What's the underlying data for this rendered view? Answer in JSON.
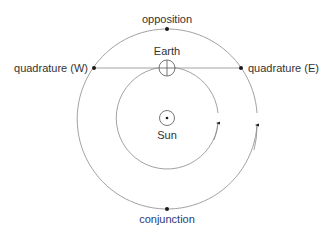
{
  "diagram": {
    "labels": {
      "opposition": "opposition",
      "quadrature_west": "quadrature (W)",
      "quadrature_east": "quadrature (E)",
      "earth": "Earth",
      "sun": "Sun",
      "conjunction": "conjunction"
    },
    "colors": {
      "orbit": "#8a8a8a",
      "dot": "#1a1a1a",
      "text": "#333333",
      "conjunction_text": "#2b3a7a"
    }
  }
}
